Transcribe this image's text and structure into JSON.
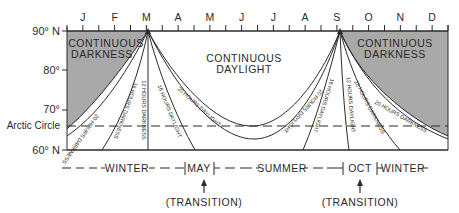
{
  "diagram": {
    "months": [
      "J",
      "F",
      "M",
      "A",
      "M",
      "J",
      "J",
      "A",
      "S",
      "O",
      "N",
      "D"
    ],
    "latitude_labels": {
      "lat90": "90° N",
      "lat80": "80°",
      "lat70": "70°",
      "arctic": "Arctic Circle",
      "lat60": "60° N"
    },
    "regions": {
      "dark_left_line1": "CONTINUOUS",
      "dark_left_line2": "DARKNESS",
      "day_line1": "CONTINUOUS",
      "day_line2": "DAYLIGHT",
      "dark_right_line1": "CONTINUOUS",
      "dark_right_line2": "DARKNESS"
    },
    "curve_labels": {
      "spring_20_dark": "20 HOURS DARKNESS",
      "spring_16_dark": "16 HOURS DARKNESS",
      "spring_12": "12 HOURS DARKNESS",
      "spring_16_day": "16 HOURS DAYLIGHT",
      "spring_20_day": "20 HOURS DAYLIGHT",
      "fall_20_day": "20 HOURS DAYLIGHT",
      "fall_16_day": "16 HOURS DAYLIGHT",
      "fall_12": "12 HOURS DAYLIGHT",
      "fall_16_dark": "16 HOURS DARKNESS",
      "fall_20_dark": "20 HOURS DARKNESS"
    },
    "seasons": {
      "winter1": "WINTER",
      "may": "MAY",
      "summer": "SUMMER",
      "oct": "OCT",
      "winter2": "WINTER",
      "transition1": "(TRANSITION)",
      "transition2": "(TRANSITION)"
    },
    "colors": {
      "darkness_fill": "#a9a9a9",
      "line": "#2a2a2a"
    }
  }
}
